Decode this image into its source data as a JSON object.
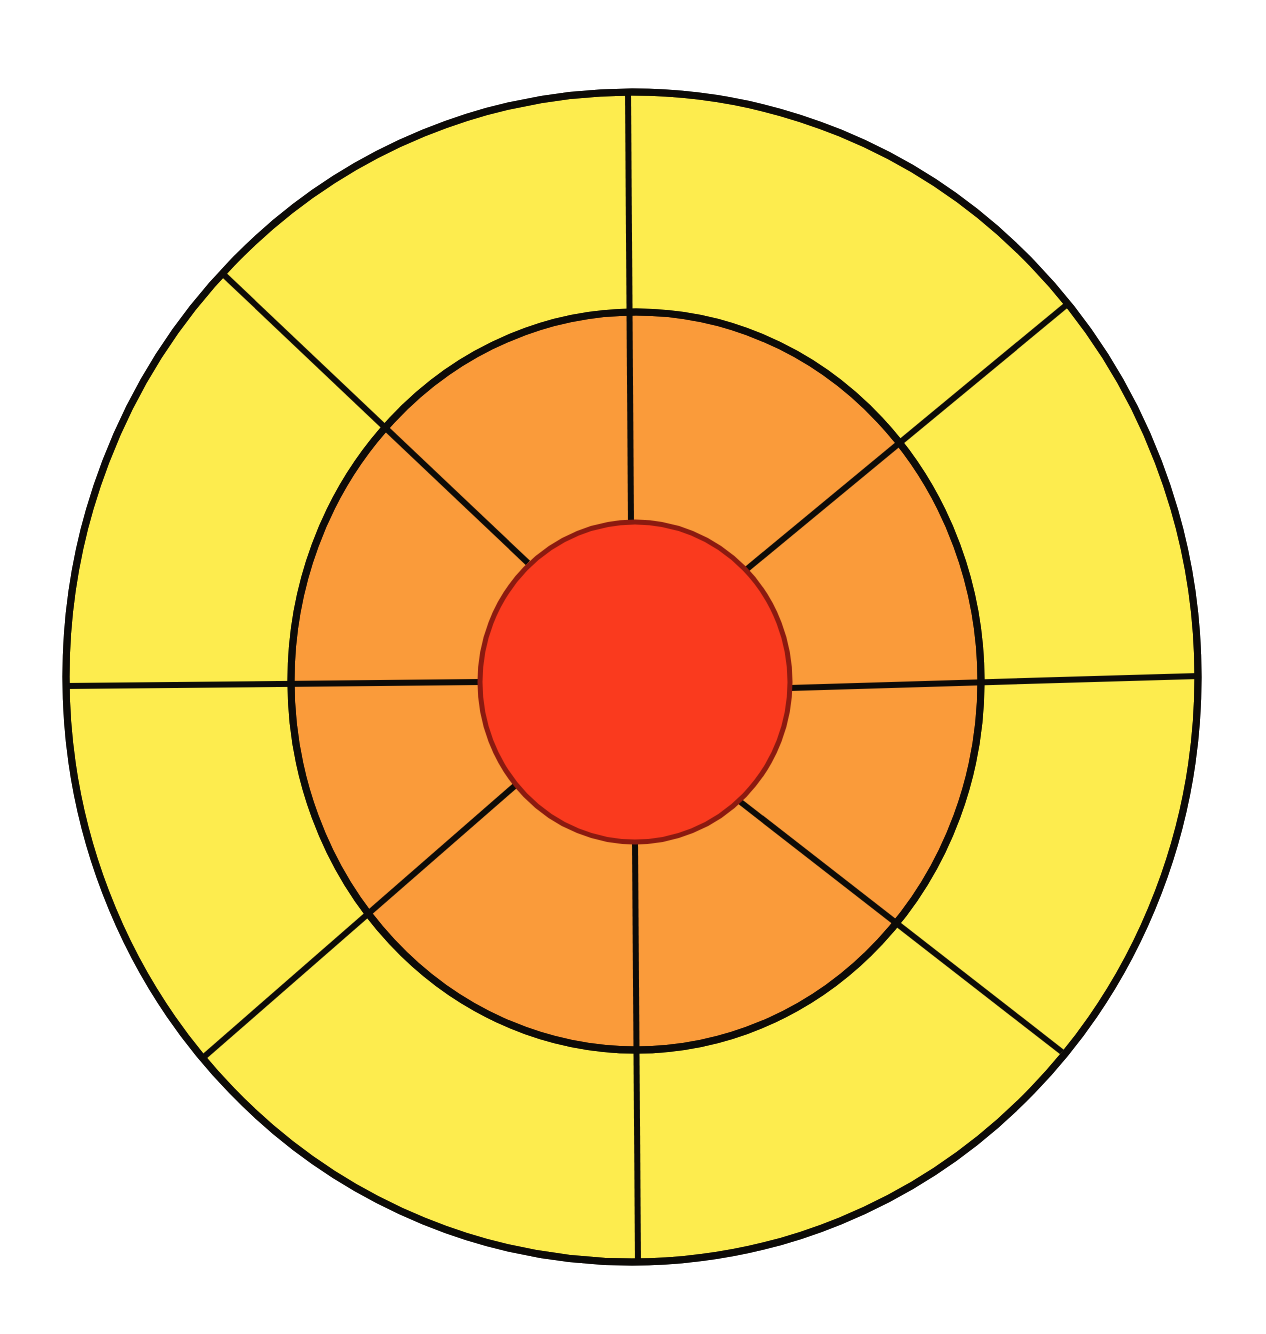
{
  "diagram": {
    "background": "#ffffff",
    "stroke_color": "#0d0b08",
    "stroke_width": 6,
    "rings": [
      {
        "name": "outer-ring",
        "fill": "#fdec4e",
        "cx": 632,
        "cy": 677,
        "rx": 566,
        "ry": 585,
        "stroke": "#0d0b08",
        "stroke_width": 7,
        "segments": 8
      },
      {
        "name": "middle-ring",
        "fill": "#fa9b3a",
        "cx": 636,
        "cy": 681,
        "rx": 345,
        "ry": 369,
        "stroke": "#0d0b08",
        "stroke_width": 7,
        "segments": 8
      },
      {
        "name": "center-circle",
        "fill": "#fa3a1e",
        "cx": 635,
        "cy": 682,
        "rx": 155,
        "ry": 160,
        "stroke": "#8b1a10",
        "stroke_width": 5,
        "segments": 1
      }
    ],
    "spokes": [
      {
        "name": "spoke-top",
        "x1": 631,
        "y1": 524,
        "x2": 628,
        "y2": 92
      },
      {
        "name": "spoke-upper-right",
        "x1": 747,
        "y1": 569,
        "x2": 1070,
        "y2": 302
      },
      {
        "name": "spoke-right",
        "x1": 790,
        "y1": 688,
        "x2": 1199,
        "y2": 676
      },
      {
        "name": "spoke-lower-right",
        "x1": 738,
        "y1": 800,
        "x2": 1062,
        "y2": 1052
      },
      {
        "name": "spoke-bottom",
        "x1": 635,
        "y1": 842,
        "x2": 638,
        "y2": 1262
      },
      {
        "name": "spoke-lower-left",
        "x1": 517,
        "y1": 784,
        "x2": 205,
        "y2": 1056
      },
      {
        "name": "spoke-left",
        "x1": 481,
        "y1": 682,
        "x2": 66,
        "y2": 686
      },
      {
        "name": "spoke-upper-left",
        "x1": 528,
        "y1": 563,
        "x2": 222,
        "y2": 273
      }
    ]
  }
}
